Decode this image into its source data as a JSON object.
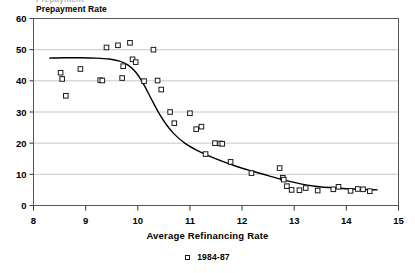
{
  "figure": {
    "clipped_header": "Prepayment",
    "y_axis_title": "Prepayment Rate",
    "x_axis_title": "Average Refinancing Rate"
  },
  "legend": {
    "marker": "open-square-marker",
    "label": "1984-87"
  },
  "chart_data": {
    "type": "scatter",
    "title": "",
    "xlabel": "Average Refinancing Rate",
    "ylabel": "Prepayment Rate",
    "xlim": [
      8,
      15
    ],
    "ylim": [
      0,
      60
    ],
    "xticks": [
      8,
      9,
      10,
      11,
      12,
      13,
      14,
      15
    ],
    "yticks": [
      0,
      10,
      20,
      30,
      40,
      50,
      60
    ],
    "grid": "horizontal",
    "legend_position": "bottom-center",
    "series": [
      {
        "name": "1984-87",
        "marker": "open square",
        "points": [
          [
            8.52,
            42.6
          ],
          [
            8.55,
            40.6
          ],
          [
            8.62,
            35.2
          ],
          [
            8.9,
            43.8
          ],
          [
            9.28,
            40.2
          ],
          [
            9.32,
            40.1
          ],
          [
            9.4,
            50.7
          ],
          [
            9.62,
            51.4
          ],
          [
            9.7,
            40.9
          ],
          [
            9.72,
            44.7
          ],
          [
            9.85,
            52.2
          ],
          [
            9.9,
            46.9
          ],
          [
            9.96,
            46.0
          ],
          [
            10.12,
            39.9
          ],
          [
            10.3,
            50.0
          ],
          [
            10.38,
            40.1
          ],
          [
            10.45,
            37.2
          ],
          [
            10.62,
            30.0
          ],
          [
            10.7,
            26.4
          ],
          [
            11.0,
            29.6
          ],
          [
            11.12,
            24.5
          ],
          [
            11.22,
            25.3
          ],
          [
            11.48,
            20.0
          ],
          [
            11.58,
            19.9
          ],
          [
            11.62,
            19.8
          ],
          [
            11.3,
            16.5
          ],
          [
            11.78,
            14.0
          ],
          [
            12.18,
            10.4
          ],
          [
            12.72,
            12.0
          ],
          [
            12.78,
            8.9
          ],
          [
            12.8,
            8.3
          ],
          [
            12.86,
            6.2
          ],
          [
            12.95,
            5.0
          ],
          [
            13.1,
            4.9
          ],
          [
            13.22,
            5.6
          ],
          [
            13.45,
            4.8
          ],
          [
            13.75,
            5.2
          ],
          [
            13.85,
            6.0
          ],
          [
            14.08,
            4.7
          ],
          [
            14.22,
            5.3
          ],
          [
            14.32,
            5.2
          ],
          [
            14.45,
            4.6
          ]
        ]
      }
    ],
    "fitted_curve": {
      "name": "logistic-fit-line",
      "points": [
        [
          8.3,
          47.3
        ],
        [
          8.6,
          47.4
        ],
        [
          8.9,
          47.4
        ],
        [
          9.2,
          47.3
        ],
        [
          9.45,
          47.0
        ],
        [
          9.65,
          46.3
        ],
        [
          9.8,
          45.2
        ],
        [
          9.95,
          43.0
        ],
        [
          10.1,
          39.3
        ],
        [
          10.25,
          34.5
        ],
        [
          10.4,
          29.8
        ],
        [
          10.55,
          25.9
        ],
        [
          10.7,
          22.9
        ],
        [
          10.9,
          20.0
        ],
        [
          11.1,
          18.0
        ],
        [
          11.35,
          16.0
        ],
        [
          11.6,
          14.3
        ],
        [
          11.9,
          12.5
        ],
        [
          12.2,
          11.0
        ],
        [
          12.5,
          9.6
        ],
        [
          12.8,
          8.2
        ],
        [
          13.1,
          7.0
        ],
        [
          13.4,
          6.2
        ],
        [
          13.8,
          5.6
        ],
        [
          14.2,
          5.2
        ],
        [
          14.6,
          5.0
        ]
      ]
    }
  }
}
